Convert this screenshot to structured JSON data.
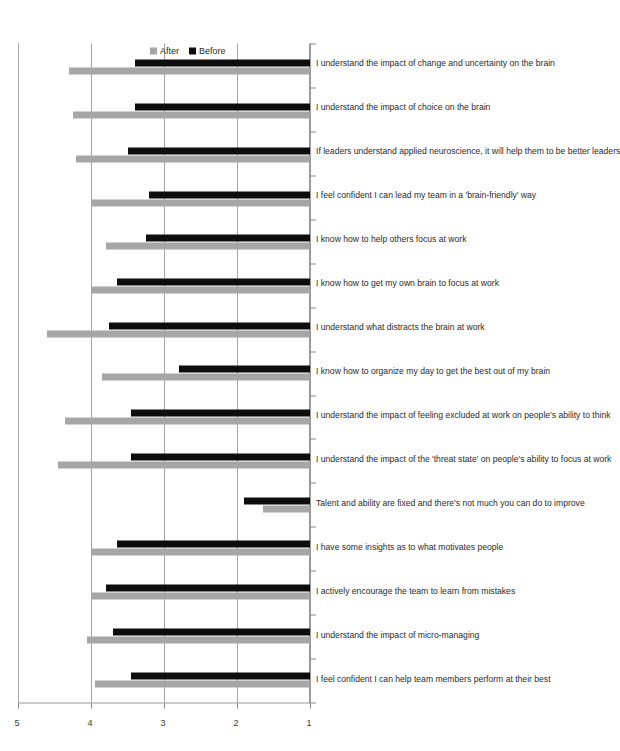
{
  "chart_data": {
    "type": "bar",
    "title": "",
    "xlabel": "",
    "ylabel": "",
    "ylim": [
      1,
      5
    ],
    "yticks": [
      1,
      2,
      3,
      4,
      5
    ],
    "grid": true,
    "legend_position": "bottom-right",
    "orientation": "vertical-rotated",
    "categories": [
      "I feel confident I can help team members perform at their best",
      "I understand the impact of micro-managing",
      "I actively encourage the team to learn from mistakes",
      "I have some insights as to what motivates people",
      "Talent and ability are fixed and there's not much you can do to improve",
      "I understand the impact of the 'threat state' on people's ability to focus at work",
      "I understand the impact of feeling excluded at work on people's ability to think",
      "I know how to organize my day to get the best out of my brain",
      "I understand what distracts the brain at work",
      "I know how to get my own brain to focus at work",
      "I know how to help others focus at work",
      "I feel confident I can lead my team in a 'brain-friendly' way",
      "If leaders understand applied neuroscience, it will help them to be better leaders",
      "I understand the impact of choice on the brain",
      "I understand the impact of change and uncertainty on the brain"
    ],
    "series": [
      {
        "name": "After",
        "color": "#a6a6a6",
        "values": [
          3.95,
          4.05,
          4.0,
          4.0,
          1.65,
          4.45,
          4.35,
          3.85,
          4.6,
          4.0,
          3.8,
          4.0,
          4.2,
          4.25,
          4.3
        ]
      },
      {
        "name": "Before",
        "color": "#0d0d0d",
        "values": [
          3.45,
          3.7,
          3.8,
          3.65,
          1.9,
          3.45,
          3.45,
          2.8,
          3.75,
          3.65,
          3.25,
          3.2,
          3.5,
          3.4,
          3.4
        ]
      }
    ]
  },
  "legend": {
    "items": [
      {
        "label": "After",
        "color": "#a6a6a6"
      },
      {
        "label": "Before",
        "color": "#0d0d0d"
      }
    ]
  }
}
